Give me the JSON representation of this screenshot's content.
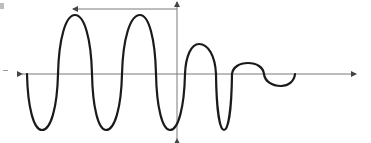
{
  "diagram": {
    "colors": {
      "curve": "#1a1a1a",
      "axis": "#7a7a7a",
      "background": "#ffffff"
    },
    "axes": {
      "horizontal": {
        "y": 74,
        "x_start": 22,
        "x_end": 356,
        "arrows": "both"
      },
      "vertical": {
        "x": 177,
        "y_start": 2,
        "y_end": 139,
        "arrows": "both"
      },
      "top_indicator": {
        "y": 9,
        "x_start": 73,
        "x_end": 177,
        "arrow": "left"
      }
    },
    "waveform": {
      "description": "Three full-amplitude cycles followed by decaying oscillation",
      "points": [
        [
          27,
          74
        ],
        [
          42,
          130
        ],
        [
          58,
          74
        ],
        [
          75,
          15
        ],
        [
          92,
          74
        ],
        [
          106,
          130
        ],
        [
          122,
          74
        ],
        [
          140,
          15
        ],
        [
          156,
          74
        ],
        [
          170,
          130
        ],
        [
          185,
          74
        ],
        [
          199,
          44
        ],
        [
          216,
          74
        ],
        [
          224,
          130
        ],
        [
          232,
          74
        ],
        [
          248,
          63
        ],
        [
          264,
          74
        ],
        [
          281,
          86
        ],
        [
          295,
          74
        ]
      ]
    }
  }
}
